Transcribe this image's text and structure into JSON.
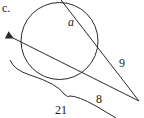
{
  "figure": {
    "part_label": "c.",
    "labels": {
      "arc_segment": "a",
      "secant_external": "9",
      "tangent_or_secant_external": "8",
      "brace_total": "21"
    },
    "colors": {
      "stroke": "#2a2a2a",
      "background": "#ffffff"
    }
  }
}
